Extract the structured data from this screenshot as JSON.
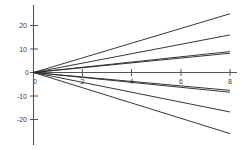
{
  "chart_data": {
    "type": "line",
    "title": "",
    "subtitle": "",
    "xlabel": "",
    "ylabel": "",
    "xlim": [
      -0.35,
      8.6
    ],
    "ylim": [
      -27.5,
      27.5
    ],
    "grid": false,
    "legend": null,
    "xticks": [
      0,
      2,
      4,
      6,
      8
    ],
    "xtick_labels": [
      "0",
      "2",
      "4",
      "6",
      "8"
    ],
    "yticks": [
      -20,
      -10,
      0,
      10,
      20
    ],
    "ytick_labels": [
      "-20",
      "-10",
      "0",
      "10",
      "20"
    ],
    "axis_color": "#555555",
    "line_color": "#2b2b2b",
    "x": [
      0,
      8
    ],
    "series": [
      {
        "name": "slope +3.12",
        "slope": 3.12,
        "values": [
          0,
          25.0
        ]
      },
      {
        "name": "slope +2.00",
        "slope": 2.0,
        "values": [
          0,
          16.0
        ]
      },
      {
        "name": "slope +1.12",
        "slope": 1.12,
        "values": [
          0,
          8.9
        ]
      },
      {
        "name": "slope +1.02",
        "slope": 1.02,
        "values": [
          0,
          8.2
        ]
      },
      {
        "name": "slope -0.95",
        "slope": -0.95,
        "values": [
          0,
          -7.6
        ]
      },
      {
        "name": "slope -1.05",
        "slope": -1.05,
        "values": [
          0,
          -8.4
        ]
      },
      {
        "name": "slope -2.10",
        "slope": -2.1,
        "values": [
          0,
          -16.8
        ]
      },
      {
        "name": "slope -3.25",
        "slope": -3.25,
        "values": [
          0,
          -26.0
        ]
      }
    ]
  }
}
